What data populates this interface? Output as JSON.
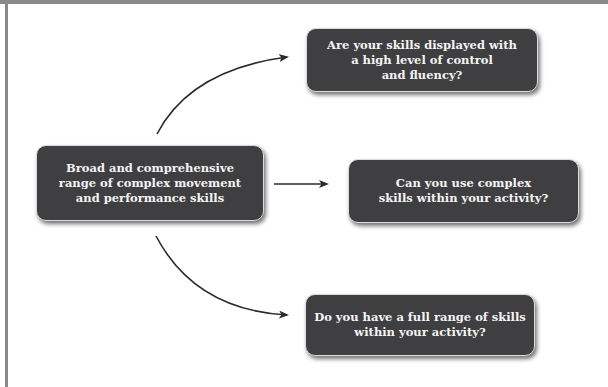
{
  "diagram": {
    "type": "flow",
    "colors": {
      "box_fill": "#3f3f41",
      "box_text": "#f4f4f4",
      "box_border": "#dcdcdc",
      "arrow": "#2a2a2a",
      "frame": "#8a8a8a",
      "background": "#ffffff"
    },
    "source": {
      "label": "Broad and comprehensive\nrange of complex movement\nand performance skills"
    },
    "questions": [
      {
        "label": "Are your skills displayed with\na high level of control\nand fluency?"
      },
      {
        "label": "Can you use complex\nskills within your activity?"
      },
      {
        "label": "Do you have a full range of skills\nwithin your activity?"
      }
    ],
    "edges": [
      {
        "from": "source",
        "to": "questions.0",
        "style": "curved-arrow-up"
      },
      {
        "from": "source",
        "to": "questions.1",
        "style": "straight-arrow"
      },
      {
        "from": "source",
        "to": "questions.2",
        "style": "curved-arrow-down"
      }
    ]
  }
}
